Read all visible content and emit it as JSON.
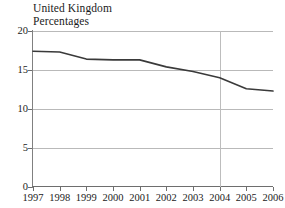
{
  "header": {
    "title": "United Kingdom",
    "subtitle": "Percentages"
  },
  "chart_data": {
    "type": "line",
    "title": "United Kingdom",
    "subtitle": "Percentages",
    "xlabel": "",
    "ylabel": "",
    "categories": [
      "1997",
      "1998",
      "1999",
      "2000",
      "2001",
      "2002",
      "2003",
      "2004",
      "2005",
      "2006"
    ],
    "values": [
      17.4,
      17.3,
      16.4,
      16.3,
      16.3,
      15.4,
      14.8,
      14.0,
      12.6,
      12.3
    ],
    "x": [
      1997,
      1998,
      1999,
      2000,
      2001,
      2002,
      2003,
      2004,
      2005,
      2006
    ],
    "ylim": [
      0,
      20
    ],
    "yticks": [
      "0",
      "5",
      "10",
      "15",
      "20"
    ],
    "ytick_values": [
      0,
      5,
      10,
      15,
      20
    ],
    "xlim": [
      1997,
      2006
    ],
    "grid": "horizontal-gridlines-plus-vertical-at-2004",
    "vertical_gridline_at": "2004",
    "legend": "none",
    "line_color": "#3a3a3a",
    "gridline_color": "#b9b9b9",
    "axis_color": "#6e6e6e"
  }
}
